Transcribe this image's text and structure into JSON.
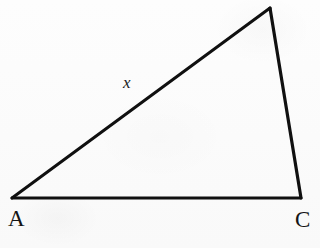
{
  "figure": {
    "type": "geometry-diagram",
    "shape": "triangle",
    "canvas": {
      "width": 320,
      "height": 248
    },
    "background_color": "#fcfcfc",
    "stroke_color": "#101010",
    "stroke_width": 3,
    "text_color": "#151515",
    "vertices": [
      {
        "name": "A",
        "label": "A",
        "x": 12,
        "y": 198,
        "labeled": true
      },
      {
        "name": "B",
        "label": "",
        "x": 270,
        "y": 8,
        "labeled": false
      },
      {
        "name": "C",
        "label": "C",
        "x": 301,
        "y": 198,
        "labeled": true
      }
    ],
    "sides": [
      {
        "name": "AB",
        "label": "x",
        "from": "A",
        "to": "B",
        "labeled": true
      },
      {
        "name": "BC",
        "label": "",
        "from": "B",
        "to": "C",
        "labeled": false
      },
      {
        "name": "AC",
        "label": "",
        "from": "A",
        "to": "C",
        "labeled": false
      }
    ],
    "labels": {
      "vertex_a": "A",
      "vertex_c": "C",
      "side_ab": "x"
    },
    "polygon_points": "12,198 270,8 301,198"
  }
}
